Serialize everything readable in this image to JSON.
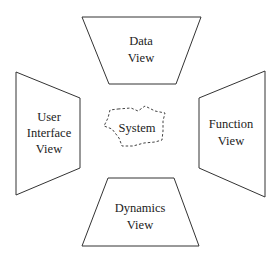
{
  "diagram": {
    "center": {
      "label": "System",
      "style": "dashed-cloud"
    },
    "views": [
      {
        "id": "data",
        "position": "top",
        "lines": [
          "Data",
          "View"
        ]
      },
      {
        "id": "user-interface",
        "position": "left",
        "lines": [
          "User",
          "Interface",
          "View"
        ]
      },
      {
        "id": "function",
        "position": "right",
        "lines": [
          "Function",
          "View"
        ]
      },
      {
        "id": "dynamics",
        "position": "bottom",
        "lines": [
          "Dynamics",
          "View"
        ]
      }
    ]
  }
}
